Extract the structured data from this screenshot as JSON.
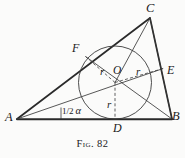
{
  "figure": {
    "caption_prefix": "Fig.",
    "caption_number": "82",
    "caption_full": "Fig. 82",
    "background_color": "#fbfbfa",
    "ink_color": "#1a1a1a"
  },
  "labels": {
    "vertex_a": "A",
    "vertex_b": "B",
    "vertex_c": "C",
    "point_d": "D",
    "point_e": "E",
    "point_f": "F",
    "center_o": "O",
    "radius_left": "r",
    "radius_right": "r",
    "radius_bottom": "r",
    "angle_fraction": "1/2",
    "angle_numerator": "1",
    "angle_denominator": "2",
    "angle_symbol": "α"
  },
  "geometry": {
    "type": "incircle-of-triangle",
    "points": {
      "A": [
        17,
        119
      ],
      "B": [
        172,
        119
      ],
      "C": [
        150,
        18
      ],
      "D": [
        115,
        119
      ],
      "E": [
        163.2,
        68.5
      ],
      "F": [
        85.5,
        56.5
      ],
      "O": [
        115,
        82.5
      ]
    },
    "incircle": {
      "cx": 115,
      "cy": 82.5,
      "r": 36.5
    },
    "solid_lines": [
      [
        "A",
        "B"
      ],
      [
        "B",
        "C"
      ],
      [
        "C",
        "A"
      ],
      [
        "A",
        "E"
      ],
      [
        "C",
        "O"
      ],
      [
        "C",
        "B"
      ]
    ],
    "dashed_radii": [
      [
        "O",
        "F"
      ],
      [
        "O",
        "E"
      ],
      [
        "O",
        "D"
      ]
    ],
    "angle_mark": {
      "at": "A",
      "label": "1/2 α",
      "tick_x": 61,
      "tick_y_top": 108,
      "tick_y_bottom": 119
    }
  }
}
